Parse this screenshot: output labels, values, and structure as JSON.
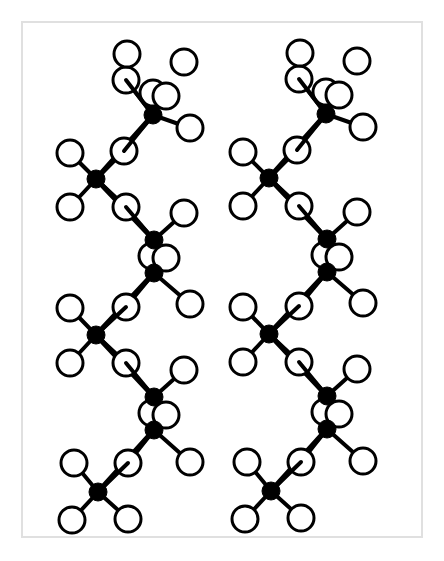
{
  "figure": {
    "background_color": "#ffffff",
    "frame_color": "#e0e0e0",
    "frame": {
      "x": 21,
      "y": 21,
      "width": 402,
      "height": 517,
      "border_width": 2
    },
    "canvas": {
      "width": 444,
      "height": 561
    }
  },
  "legend": {
    "carbon_label": "carbon",
    "carbon_color": "#000000",
    "carbon_radius": 9,
    "hydrogen_label": "hydrogen",
    "hydrogen_color": "#ffffff",
    "hydrogen_outline_color": "#000000",
    "hydrogen_radius": 13,
    "hydrogen_outline_width": 3,
    "bond_color": "#000000",
    "bond_width": 4
  },
  "chains": [
    {
      "name": "chain-left",
      "x_offset": 0,
      "y_offset": 0
    },
    {
      "name": "chain-right",
      "x_offset": 173,
      "y_offset": -1
    }
  ],
  "chain_template": {
    "carbons": [
      {
        "id": "C1",
        "x": 153,
        "y": 115
      },
      {
        "id": "C2",
        "x": 96,
        "y": 179
      },
      {
        "id": "C3",
        "x": 154,
        "y": 240
      },
      {
        "id": "C4",
        "x": 154,
        "y": 273
      },
      {
        "id": "C5",
        "x": 96,
        "y": 335
      },
      {
        "id": "C6",
        "x": 154,
        "y": 397
      },
      {
        "id": "C7",
        "x": 154,
        "y": 430
      },
      {
        "id": "C8",
        "x": 98,
        "y": 492
      }
    ],
    "hydrogens": [
      {
        "id": "H1a",
        "x": 126,
        "y": 80
      },
      {
        "id": "H1b",
        "x": 127,
        "y": 54
      },
      {
        "id": "H1c",
        "x": 184,
        "y": 62
      },
      {
        "id": "H1d",
        "x": 153,
        "y": 93
      },
      {
        "id": "H1e",
        "x": 166,
        "y": 96
      },
      {
        "id": "H1f",
        "x": 190,
        "y": 128
      },
      {
        "id": "H2a",
        "x": 124,
        "y": 151
      },
      {
        "id": "H2b",
        "x": 70,
        "y": 153
      },
      {
        "id": "H2c",
        "x": 70,
        "y": 207
      },
      {
        "id": "H2d",
        "x": 126,
        "y": 207
      },
      {
        "id": "H3a",
        "x": 184,
        "y": 213
      },
      {
        "id": "H3b",
        "x": 152,
        "y": 256
      },
      {
        "id": "H3c",
        "x": 166,
        "y": 258
      },
      {
        "id": "H4a",
        "x": 126,
        "y": 307
      },
      {
        "id": "H4b",
        "x": 190,
        "y": 304
      },
      {
        "id": "H5a",
        "x": 70,
        "y": 308
      },
      {
        "id": "H5b",
        "x": 70,
        "y": 363
      },
      {
        "id": "H5c",
        "x": 126,
        "y": 363
      },
      {
        "id": "H6a",
        "x": 184,
        "y": 370
      },
      {
        "id": "H6b",
        "x": 152,
        "y": 413
      },
      {
        "id": "H6c",
        "x": 166,
        "y": 415
      },
      {
        "id": "H7a",
        "x": 128,
        "y": 463
      },
      {
        "id": "H7b",
        "x": 190,
        "y": 462
      },
      {
        "id": "H8a",
        "x": 74,
        "y": 463
      },
      {
        "id": "H8b",
        "x": 72,
        "y": 520
      },
      {
        "id": "H8c",
        "x": 128,
        "y": 519
      }
    ],
    "backbone_bonds": [
      {
        "from": "C1",
        "to": "C2"
      },
      {
        "from": "C2",
        "to": "C3"
      },
      {
        "from": "C3",
        "to": "C4"
      },
      {
        "from": "C4",
        "to": "C5"
      },
      {
        "from": "C5",
        "to": "C6"
      },
      {
        "from": "C6",
        "to": "C7"
      },
      {
        "from": "C7",
        "to": "C8"
      }
    ],
    "hydrogen_bonds": [
      {
        "carbon": "C1",
        "hydrogen": "H1d"
      },
      {
        "carbon": "C1",
        "hydrogen": "H1e"
      },
      {
        "carbon": "C1",
        "hydrogen": "H1f"
      },
      {
        "carbon": "C1",
        "hydrogen": "H1a"
      },
      {
        "carbon": "C2",
        "hydrogen": "H2a"
      },
      {
        "carbon": "C2",
        "hydrogen": "H2b"
      },
      {
        "carbon": "C2",
        "hydrogen": "H2c"
      },
      {
        "carbon": "C2",
        "hydrogen": "H2d"
      },
      {
        "carbon": "C3",
        "hydrogen": "H3a"
      },
      {
        "carbon": "C3",
        "hydrogen": "H3b"
      },
      {
        "carbon": "C3",
        "hydrogen": "H3c"
      },
      {
        "carbon": "C4",
        "hydrogen": "H3b"
      },
      {
        "carbon": "C4",
        "hydrogen": "H3c"
      },
      {
        "carbon": "C4",
        "hydrogen": "H4a"
      },
      {
        "carbon": "C4",
        "hydrogen": "H4b"
      },
      {
        "carbon": "C5",
        "hydrogen": "H5a"
      },
      {
        "carbon": "C5",
        "hydrogen": "H5b"
      },
      {
        "carbon": "C5",
        "hydrogen": "H5c"
      },
      {
        "carbon": "C6",
        "hydrogen": "H6a"
      },
      {
        "carbon": "C6",
        "hydrogen": "H6b"
      },
      {
        "carbon": "C6",
        "hydrogen": "H6c"
      },
      {
        "carbon": "C7",
        "hydrogen": "H6b"
      },
      {
        "carbon": "C7",
        "hydrogen": "H6c"
      },
      {
        "carbon": "C7",
        "hydrogen": "H7a"
      },
      {
        "carbon": "C7",
        "hydrogen": "H7b"
      },
      {
        "carbon": "C8",
        "hydrogen": "H8a"
      },
      {
        "carbon": "C8",
        "hydrogen": "H8b"
      },
      {
        "carbon": "C8",
        "hydrogen": "H8c"
      }
    ],
    "bridge_hydrogens": [
      {
        "hydrogen": "H1a",
        "carbon": "C1"
      },
      {
        "hydrogen": "H2a",
        "carbon": "C1"
      },
      {
        "hydrogen": "H2d",
        "carbon": "C3"
      },
      {
        "hydrogen": "H4a",
        "carbon": "C5"
      },
      {
        "hydrogen": "H5c",
        "carbon": "C6"
      },
      {
        "hydrogen": "H7a",
        "carbon": "C8"
      }
    ]
  }
}
